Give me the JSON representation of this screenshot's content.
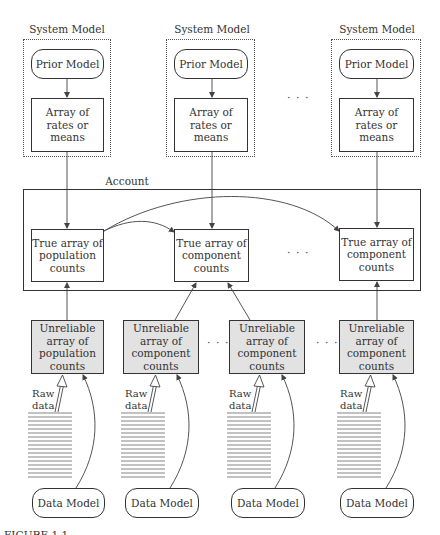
{
  "diagram": {
    "system_models": [
      {
        "title": "System Model",
        "prior": "Prior Model",
        "array": [
          "Array of",
          "rates or",
          "means"
        ]
      },
      {
        "title": "System Model",
        "prior": "Prior Model",
        "array": [
          "Array of",
          "rates or",
          "means"
        ]
      },
      {
        "title": "System Model",
        "prior": "Prior Model",
        "array": [
          "Array of",
          "rates or",
          "means"
        ]
      }
    ],
    "top_ellipsis": "· · ·",
    "account": {
      "title": "Account",
      "true_arrays": [
        {
          "lines": [
            "True array of",
            "population",
            "counts"
          ]
        },
        {
          "lines": [
            "True array of",
            "component",
            "counts"
          ]
        },
        {
          "lines": [
            "True array of",
            "component",
            "counts"
          ]
        }
      ],
      "ellipsis": "· · ·"
    },
    "observations": [
      {
        "unreliable": [
          "Unreliable",
          "array of",
          "population",
          "counts"
        ],
        "raw": [
          "Raw",
          "data"
        ],
        "data_model": "Data Model"
      },
      {
        "unreliable": [
          "Unreliable",
          "array of",
          "component",
          "counts"
        ],
        "raw": [
          "Raw",
          "data"
        ],
        "data_model": "Data Model"
      },
      {
        "unreliable": [
          "Unreliable",
          "array of",
          "component",
          "counts"
        ],
        "raw": [
          "Raw",
          "data"
        ],
        "data_model": "Data Model"
      },
      {
        "unreliable": [
          "Unreliable",
          "array of",
          "component",
          "counts"
        ],
        "raw": [
          "Raw",
          "data"
        ],
        "data_model": "Data Model"
      }
    ],
    "bottom_ellipses": [
      "· · ·",
      "· · ·"
    ],
    "caption_partial": "FIGURE 1.1 ..."
  },
  "colors": {
    "shaded_fill": "#e2e2e2",
    "line": "#333333",
    "background": "#ffffff"
  }
}
